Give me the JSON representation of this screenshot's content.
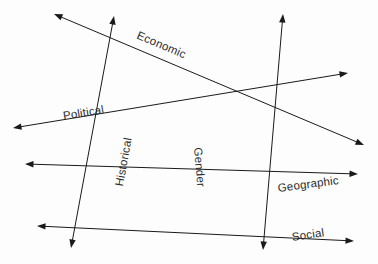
{
  "diagram": {
    "type": "radial-axes-diagram",
    "background_color": "#fdfdfd",
    "line_color": "#1a1a1a",
    "label_color": "#2b2b2b",
    "axes": [
      {
        "id": "economic",
        "label": "Economic",
        "x1": 54,
        "y1": 14,
        "x2": 364,
        "y2": 145,
        "label_x": 140,
        "label_y": 29,
        "label_rotation": 22.9
      },
      {
        "id": "political",
        "label": "Political",
        "x1": 13,
        "y1": 128,
        "x2": 348,
        "y2": 73,
        "label_x": 62,
        "label_y": 110,
        "label_rotation": -9.4
      },
      {
        "id": "historical",
        "label": "Historical",
        "x1": 114,
        "y1": 16,
        "x2": 71,
        "y2": 248,
        "label_x": 113,
        "label_y": 185,
        "label_rotation": -79.5
      },
      {
        "id": "gender",
        "label": "Gender",
        "x1": 283,
        "y1": 14,
        "x2": 263,
        "y2": 250,
        "label_x": 204,
        "label_y": 147,
        "label_rotation": 85.2
      },
      {
        "id": "geographic",
        "label": "Geographic",
        "x1": 25,
        "y1": 164,
        "x2": 358,
        "y2": 174,
        "label_x": 277,
        "label_y": 182,
        "label_rotation": -7.5
      },
      {
        "id": "social",
        "label": "Social",
        "x1": 37,
        "y1": 226,
        "x2": 354,
        "y2": 241,
        "label_x": 291,
        "label_y": 231,
        "label_rotation": -8.5
      }
    ]
  }
}
